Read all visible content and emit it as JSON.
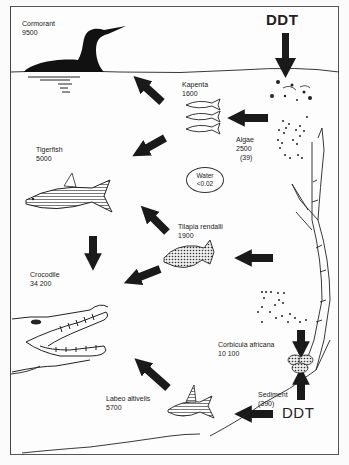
{
  "diagram": {
    "source_labels": {
      "top": "DDT",
      "bottom": "DDT"
    },
    "nodes": [
      {
        "id": "cormorant",
        "name": "Cormorant",
        "value": "9500"
      },
      {
        "id": "kapenta",
        "name": "Kapenta",
        "value": "1600"
      },
      {
        "id": "algae",
        "name": "Algae",
        "value": "2500",
        "secondary": "(39)"
      },
      {
        "id": "water",
        "name": "Water",
        "value": "<0.02"
      },
      {
        "id": "tigerfish",
        "name": "Tigerfish",
        "value": "5000"
      },
      {
        "id": "tilapia",
        "name": "Tilapia rendalli",
        "value": "1900"
      },
      {
        "id": "crocodile",
        "name": "Crocodile",
        "value": "34 200"
      },
      {
        "id": "corbicula",
        "name": "Corbicula africana",
        "value": "10 100"
      },
      {
        "id": "sediment",
        "name": "Sediment",
        "value": "(390)"
      },
      {
        "id": "labeo",
        "name": "Labeo altivelis",
        "value": "5700"
      }
    ],
    "edges": [
      {
        "from": "DDT (top)",
        "to": "algae"
      },
      {
        "from": "algae",
        "to": "kapenta"
      },
      {
        "from": "kapenta",
        "to": "cormorant"
      },
      {
        "from": "kapenta",
        "to": "tigerfish"
      },
      {
        "from": "tigerfish",
        "to": "crocodile"
      },
      {
        "from": "tilapia",
        "to": "tigerfish"
      },
      {
        "from": "tilapia",
        "to": "crocodile"
      },
      {
        "from": "algae",
        "to": "tilapia"
      },
      {
        "from": "algae",
        "to": "corbicula"
      },
      {
        "from": "sediment",
        "to": "corbicula"
      },
      {
        "from": "DDT (bottom)",
        "to": "labeo"
      },
      {
        "from": "labeo",
        "to": "crocodile"
      }
    ],
    "icons": [
      "cormorant-icon",
      "kapenta-fish-icon",
      "algae-particles-icon",
      "tigerfish-icon",
      "tilapia-fish-icon",
      "crocodile-icon",
      "aquatic-plant-icon",
      "corbicula-clam-icon",
      "labeo-fish-icon",
      "arrow-icon"
    ],
    "colors": {
      "ink": "#1a1a1a",
      "paper": "#fdfdfd",
      "frame": "#555555"
    }
  }
}
